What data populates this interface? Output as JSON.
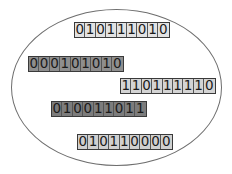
{
  "diagram": {
    "container": {
      "shape": "ellipse",
      "stroke": "#6e6e6e",
      "fill": "#ffffff"
    },
    "strings": [
      {
        "bits": "010111010",
        "fill": "#e2e2e2",
        "x": 74,
        "y": 22
      },
      {
        "bits": "000101010",
        "fill": "#8e8e8e",
        "x": 28,
        "y": 56
      },
      {
        "bits": "110111110",
        "fill": "#d4d4d4",
        "x": 120,
        "y": 78
      },
      {
        "bits": "010011011",
        "fill": "#7c7c7c",
        "x": 51,
        "y": 101
      },
      {
        "bits": "010110000",
        "fill": "#d0d0d0",
        "x": 77,
        "y": 134
      }
    ]
  }
}
